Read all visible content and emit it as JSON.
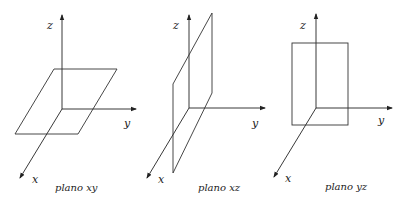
{
  "diagrams": [
    {
      "caption": "plano xy",
      "axis_labels": {
        "x": "x",
        "y": "y",
        "z": "z"
      }
    },
    {
      "caption": "plano xz",
      "axis_labels": {
        "x": "x",
        "y": "y",
        "z": "z"
      }
    },
    {
      "caption": "plano yz",
      "axis_labels": {
        "x": "x",
        "y": "y",
        "z": "z"
      }
    }
  ],
  "colors": {
    "line": "#222222",
    "background": "#ffffff"
  }
}
